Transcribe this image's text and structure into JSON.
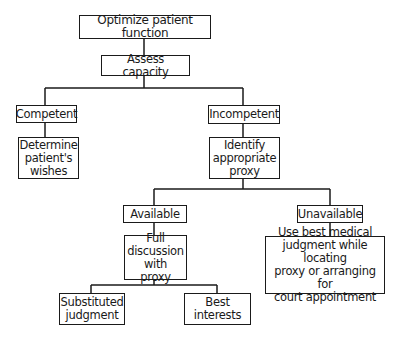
{
  "diagram": {
    "type": "decision-flowchart",
    "nodes": {
      "root": "Optimize patient function",
      "assess": "Assess capacity",
      "competent": "Competent",
      "determine": "Determine\npatient's\nwishes",
      "incompetent": "Incompetent",
      "identify": "Identify\nappropriate\nproxy",
      "available": "Available",
      "unavailable": "Unavailable",
      "full_discussion": "Full\ndiscussion\nwith proxy",
      "use_best": "Use best medical\njudgment while locating\nproxy or arranging for\ncourt appointment",
      "substituted": "Substituted\njudgment",
      "best_interests": "Best\ninterests"
    },
    "edges": [
      [
        "root",
        "assess"
      ],
      [
        "assess",
        "competent"
      ],
      [
        "assess",
        "incompetent"
      ],
      [
        "competent",
        "determine"
      ],
      [
        "incompetent",
        "identify"
      ],
      [
        "identify",
        "available"
      ],
      [
        "identify",
        "unavailable"
      ],
      [
        "available",
        "full_discussion"
      ],
      [
        "unavailable",
        "use_best"
      ],
      [
        "full_discussion",
        "substituted"
      ],
      [
        "full_discussion",
        "best_interests"
      ]
    ],
    "colors": {
      "line": "#1a1a1a",
      "background": "#ffffff"
    }
  }
}
